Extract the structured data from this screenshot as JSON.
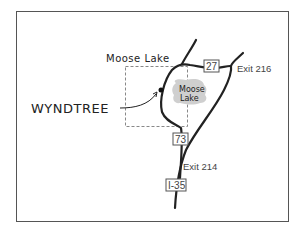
{
  "map": {
    "town_label": "Moose Lake",
    "lake_label_line1": "Moose",
    "lake_label_line2": "Lake",
    "destination_label": "WYNDTREE",
    "routes": [
      {
        "id": "hwy27",
        "label": "27"
      },
      {
        "id": "hwy73",
        "label": "73"
      },
      {
        "id": "i35",
        "label": "I-35"
      }
    ],
    "exits": [
      {
        "id": "exit216",
        "label": "Exit 216"
      },
      {
        "id": "exit214",
        "label": "Exit 214"
      }
    ],
    "colors": {
      "road": "#222222",
      "lake_fill": "#cfcfcf",
      "border": "#555555",
      "dashed_box": "#888888",
      "shield_border": "#555555"
    }
  }
}
